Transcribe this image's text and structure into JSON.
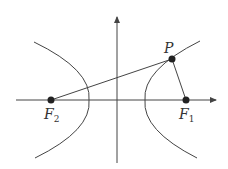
{
  "diagram": {
    "type": "hyperbola-with-foci",
    "colors": {
      "stroke": "#444444",
      "point": "#222222"
    },
    "axes": {
      "x_axis": true,
      "y_axis": true
    },
    "points": [
      {
        "id": "P",
        "label": "P",
        "subscript": ""
      },
      {
        "id": "F1",
        "label": "F",
        "subscript": "1"
      },
      {
        "id": "F2",
        "label": "F",
        "subscript": "2"
      }
    ],
    "segments": [
      "F2P",
      "PF1"
    ]
  }
}
